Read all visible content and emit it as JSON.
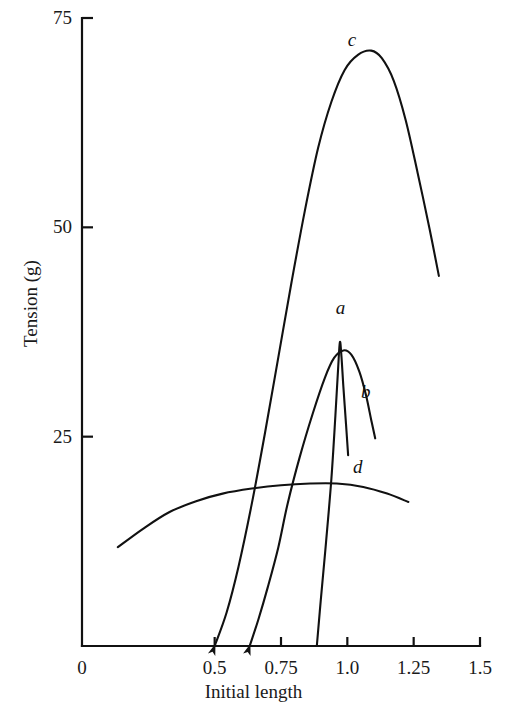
{
  "chart_data": {
    "type": "line",
    "title": "",
    "xlabel": "Initial length",
    "ylabel": "Tension (g)",
    "xlim": [
      0,
      1.5
    ],
    "ylim": [
      0,
      75
    ],
    "xticks": [
      "0",
      "0.5",
      "0.75",
      "1.0",
      "1.25",
      "1.5"
    ],
    "xtick_values": [
      0,
      0.5,
      0.75,
      1.0,
      1.25,
      1.5
    ],
    "yticks": [
      "25",
      "50",
      "75"
    ],
    "ytick_values": [
      25,
      50,
      75
    ],
    "grid": false,
    "legend": "inline-curve-labels",
    "series": [
      {
        "name": "a",
        "label": "a",
        "label_x": 0.975,
        "label_y": 40.5,
        "start_arrow": false,
        "points": [
          [
            0.885,
            0
          ],
          [
            0.9,
            5.5
          ],
          [
            0.92,
            12.5
          ],
          [
            0.94,
            20.0
          ],
          [
            0.955,
            27.5
          ],
          [
            0.965,
            33.0
          ],
          [
            0.972,
            36.3
          ],
          [
            0.978,
            34.5
          ],
          [
            0.985,
            31.0
          ],
          [
            0.995,
            26.5
          ],
          [
            1.003,
            22.8
          ]
        ]
      },
      {
        "name": "b",
        "label": "b",
        "label_x": 1.07,
        "label_y": 30.5,
        "start_arrow": true,
        "points": [
          [
            0.632,
            0
          ],
          [
            0.665,
            3.2
          ],
          [
            0.7,
            7.0
          ],
          [
            0.74,
            11.8
          ],
          [
            0.775,
            17.0
          ],
          [
            0.82,
            22.5
          ],
          [
            0.87,
            27.8
          ],
          [
            0.915,
            32.0
          ],
          [
            0.95,
            34.4
          ],
          [
            0.985,
            35.3
          ],
          [
            1.015,
            34.8
          ],
          [
            1.045,
            32.8
          ],
          [
            1.07,
            30.0
          ],
          [
            1.09,
            27.0
          ],
          [
            1.105,
            24.8
          ]
        ]
      },
      {
        "name": "c",
        "label": "c",
        "label_x": 1.02,
        "label_y": 72.5,
        "start_arrow": true,
        "points": [
          [
            0.5,
            0
          ],
          [
            0.545,
            4.0
          ],
          [
            0.59,
            9.5
          ],
          [
            0.64,
            17.0
          ],
          [
            0.69,
            25.5
          ],
          [
            0.74,
            34.5
          ],
          [
            0.79,
            43.5
          ],
          [
            0.84,
            52.0
          ],
          [
            0.89,
            59.5
          ],
          [
            0.94,
            65.0
          ],
          [
            0.99,
            68.8
          ],
          [
            1.04,
            70.6
          ],
          [
            1.09,
            71.1
          ],
          [
            1.13,
            70.2
          ],
          [
            1.175,
            67.5
          ],
          [
            1.22,
            62.8
          ],
          [
            1.265,
            56.5
          ],
          [
            1.31,
            49.8
          ],
          [
            1.345,
            44.2
          ]
        ]
      },
      {
        "name": "d",
        "label": "d",
        "label_x": 1.04,
        "label_y": 21.5,
        "start_arrow": false,
        "points": [
          [
            0.135,
            11.8
          ],
          [
            0.23,
            14.0
          ],
          [
            0.33,
            16.0
          ],
          [
            0.43,
            17.3
          ],
          [
            0.53,
            18.2
          ],
          [
            0.64,
            18.8
          ],
          [
            0.75,
            19.2
          ],
          [
            0.86,
            19.4
          ],
          [
            0.96,
            19.4
          ],
          [
            1.06,
            19.0
          ],
          [
            1.15,
            18.2
          ],
          [
            1.23,
            17.2
          ]
        ]
      }
    ]
  },
  "axes": {
    "x_title": "Initial length",
    "y_title": "Tension (g)"
  }
}
